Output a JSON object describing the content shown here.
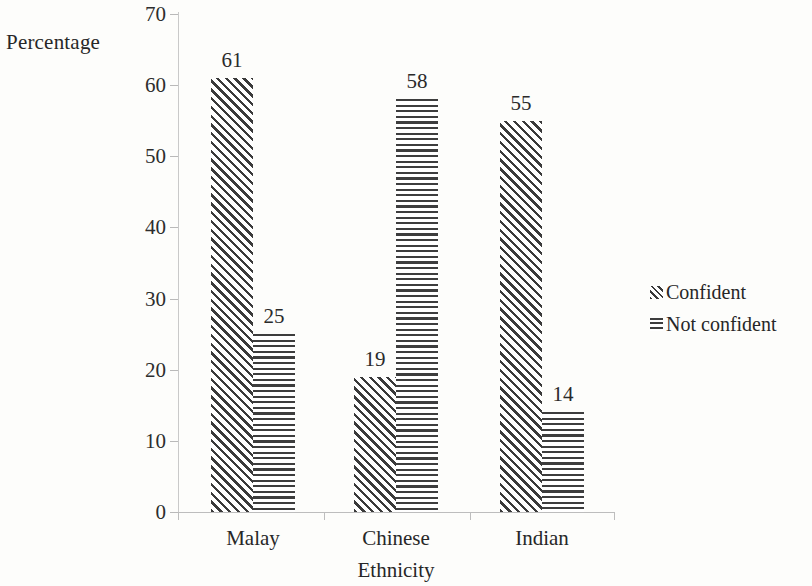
{
  "chart_data": {
    "type": "bar",
    "title": "",
    "subtitle": "",
    "xlabel": "Ethnicity",
    "ylabel": "Percentage",
    "categories": [
      "Malay",
      "Chinese",
      "Indian"
    ],
    "series": [
      {
        "name": "Confident",
        "values": [
          61,
          19,
          55
        ],
        "pattern": "diagonal-hatch"
      },
      {
        "name": "Not confident",
        "values": [
          25,
          58,
          14
        ],
        "pattern": "horizontal-lines"
      }
    ],
    "ylim": [
      0,
      70
    ],
    "yticks": [
      0,
      10,
      20,
      30,
      40,
      50,
      60,
      70
    ],
    "ytick_labels": [
      "0",
      "10",
      "20",
      "30",
      "40",
      "50",
      "60",
      "70"
    ],
    "grid": false,
    "legend_position": "right",
    "data_labels": true,
    "bar_gap_within_group": 0,
    "colors": {
      "background": "#fdfdfb",
      "ink": "#2b2b2b",
      "axis": "#c0c0c0",
      "pattern": "#3a3a3a"
    }
  },
  "legend": {
    "items": [
      {
        "label": "Confident",
        "swatch": "diagonal-hatch-swatch"
      },
      {
        "label": "Not confident",
        "swatch": "horizontal-lines-swatch"
      }
    ]
  }
}
